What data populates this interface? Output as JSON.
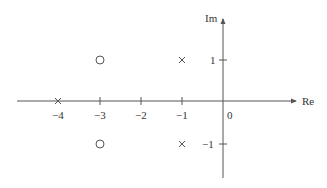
{
  "diagram": {
    "type": "pole-zero-plot",
    "axes": {
      "real_label": "Re",
      "imag_label": "Im",
      "origin_label": "0",
      "real_ticks": [
        {
          "value": -4,
          "label": "−4"
        },
        {
          "value": -3,
          "label": "−3"
        },
        {
          "value": -2,
          "label": "−2"
        },
        {
          "value": -1,
          "label": "−1"
        }
      ],
      "imag_ticks": [
        {
          "value": 1,
          "label": "1"
        },
        {
          "value": -1,
          "label": "−1"
        }
      ]
    },
    "poles": [
      {
        "re": -4,
        "im": 0,
        "marker": "x"
      },
      {
        "re": -1,
        "im": 1,
        "marker": "x"
      },
      {
        "re": -1,
        "im": -1,
        "marker": "x"
      }
    ],
    "zeros": [
      {
        "re": -3,
        "im": 1,
        "marker": "o"
      },
      {
        "re": -3,
        "im": -1,
        "marker": "o"
      }
    ],
    "colors": {
      "axis": "#555555",
      "text": "#333333",
      "marker": "#555555"
    }
  }
}
